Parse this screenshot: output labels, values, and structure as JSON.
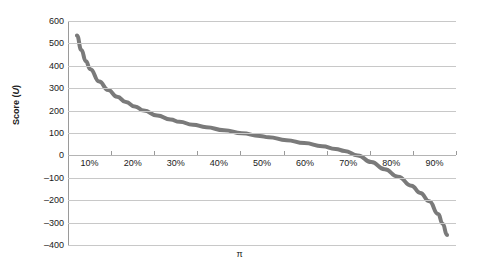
{
  "chart_data": {
    "type": "line",
    "title": "",
    "xlabel": "π",
    "ylabel_prefix": "Score (",
    "ylabel_unit": "U",
    "ylabel_suffix": ")",
    "ylabel": "Score (U)",
    "grid": true,
    "legend": false,
    "series_color": "#7a7a7a",
    "gridline_color": "#c8c8c8",
    "axis_color": "#9a9a9a",
    "background": "#ffffff",
    "ylim": [
      -400,
      600
    ],
    "ytick_step": 100,
    "ytick_labels": [
      "600",
      "500",
      "400",
      "300",
      "200",
      "100",
      "0",
      "–100",
      "–200",
      "–300",
      "–400"
    ],
    "ytick_values": [
      600,
      500,
      400,
      300,
      200,
      100,
      0,
      -100,
      -200,
      -300,
      -400
    ],
    "xtick_labels": [
      "10%",
      "20%",
      "30%",
      "40%",
      "50%",
      "60%",
      "70%",
      "80%",
      "90%"
    ],
    "xlim": [
      0.05,
      0.92
    ],
    "x": [
      0.07,
      0.08,
      0.09,
      0.1,
      0.12,
      0.14,
      0.16,
      0.18,
      0.2,
      0.22,
      0.25,
      0.28,
      0.3,
      0.33,
      0.36,
      0.4,
      0.44,
      0.48,
      0.5,
      0.54,
      0.58,
      0.62,
      0.65,
      0.67,
      0.7,
      0.73,
      0.76,
      0.79,
      0.82,
      0.84,
      0.86,
      0.88,
      0.89,
      0.9
    ],
    "values": [
      535,
      470,
      420,
      385,
      330,
      292,
      262,
      238,
      218,
      200,
      178,
      160,
      150,
      137,
      126,
      112,
      99,
      87,
      81,
      68,
      55,
      41,
      29,
      20,
      0,
      -30,
      -62,
      -95,
      -135,
      -168,
      -205,
      -262,
      -305,
      -355
    ],
    "annotations": []
  }
}
